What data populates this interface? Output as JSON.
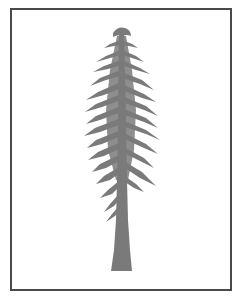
{
  "image": {
    "subject": "conifer-tree-silhouette",
    "colors": {
      "background": "#ffffff",
      "frame": "#4a4a4a",
      "tree": "#7a7a7a"
    }
  }
}
